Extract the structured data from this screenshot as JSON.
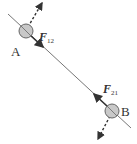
{
  "diagram": {
    "particles": [
      {
        "id": "A",
        "label": "A",
        "cx": 26,
        "cy": 31
      },
      {
        "id": "B",
        "label": "B",
        "cx": 112,
        "cy": 111
      }
    ],
    "forces": [
      {
        "id": "F12",
        "symbol": "F",
        "subscript": "12"
      },
      {
        "id": "F21",
        "symbol": "F",
        "subscript": "21"
      }
    ],
    "colors": {
      "line": "#555555",
      "ball_fill": "#c8c8c8",
      "ball_stroke": "#666666",
      "arrow": "#333333"
    }
  }
}
